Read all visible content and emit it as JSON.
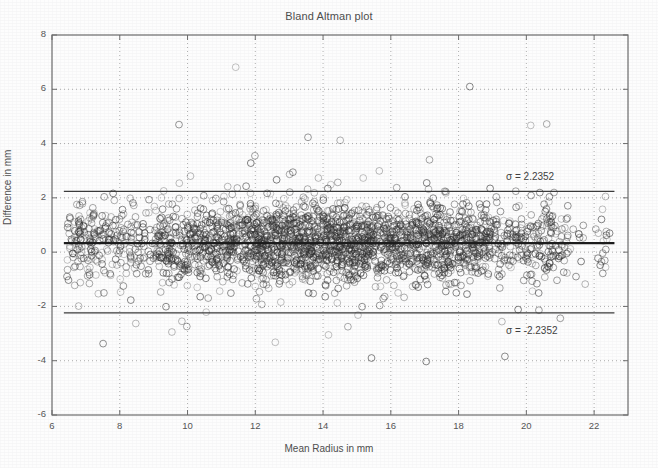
{
  "chart_data": {
    "type": "scatter",
    "title": "Bland Altman plot",
    "xlabel": "Mean Radius in mm",
    "ylabel": "Difference in mm",
    "xlim": [
      6,
      23
    ],
    "ylim": [
      -6,
      8
    ],
    "xticks": [
      6,
      8,
      10,
      12,
      14,
      16,
      18,
      20,
      22
    ],
    "yticks": [
      8,
      6,
      4,
      2,
      0,
      -2,
      -4,
      -6
    ],
    "grid": "dotted",
    "legend": "none",
    "series": [
      {
        "name": "Difference vs Mean Radius",
        "marker": "open-circle",
        "marker_size": 3.4,
        "color": "#3b3b3b",
        "n_points": 2600
      }
    ],
    "reference_lines": [
      {
        "name": "mean-bias-line",
        "orientation": "horizontal",
        "y": 0.33,
        "style": "solid",
        "width": 2.2,
        "color": "#1b1b1b",
        "x_start": 6.35,
        "x_end": 22.6
      },
      {
        "name": "upper-limit-of-agreement",
        "orientation": "horizontal",
        "y": 2.2352,
        "style": "solid",
        "width": 1.3,
        "color": "#3a3a3a",
        "x_start": 6.35,
        "x_end": 22.6
      },
      {
        "name": "lower-limit-of-agreement",
        "orientation": "horizontal",
        "y": -2.2352,
        "style": "solid",
        "width": 1.3,
        "color": "#3a3a3a",
        "x_start": 6.35,
        "x_end": 22.6
      }
    ],
    "annotations": [
      {
        "name": "upper-sigma-label",
        "text": "σ = 2.2352",
        "x": 19.4,
        "y": 2.75
      },
      {
        "name": "lower-sigma-label",
        "text": "σ = -2.2352",
        "x": 19.4,
        "y": -2.95
      }
    ],
    "scatter_description": {
      "core_band_x_range": [
        6.4,
        22.4
      ],
      "core_band_y_range": [
        -1.6,
        1.9
      ],
      "density_peak_x": [
        14.5,
        19.5
      ],
      "outlier_high_max": 7.9,
      "outlier_low_min": -4.7
    }
  }
}
